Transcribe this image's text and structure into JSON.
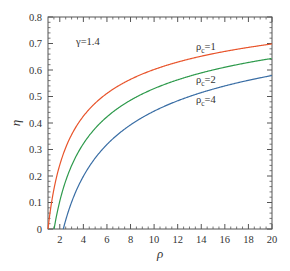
{
  "chart_data": {
    "type": "line",
    "title": "",
    "xlabel": "ρ",
    "ylabel": "η",
    "xlim": [
      1,
      20
    ],
    "ylim": [
      0,
      0.8
    ],
    "grid": false,
    "legend_position": "inline labels",
    "x_ticks": [
      2,
      4,
      6,
      8,
      10,
      12,
      14,
      16,
      18,
      20
    ],
    "x_tick_labels": [
      "2",
      "4",
      "6",
      "8",
      "10",
      "12",
      "14",
      "16",
      "18",
      "20"
    ],
    "y_ticks": [
      0,
      0.1,
      0.2,
      0.3,
      0.4,
      0.5,
      0.6,
      0.7,
      0.8
    ],
    "y_tick_labels": [
      "0",
      "0.1",
      "0.2",
      "0.3",
      "0.4",
      "0.5",
      "0.6",
      "0.7",
      "0.8"
    ],
    "annotations": [
      {
        "text": "γ=1.4",
        "x": 3.5,
        "y": 0.705
      }
    ],
    "x": [
      1,
      1.5,
      2,
      2.3,
      3,
      4,
      5,
      6,
      8,
      10,
      12,
      14,
      16,
      18,
      20
    ],
    "series": [
      {
        "name": "ρc=1",
        "label_main": "ρ",
        "label_sub": "c",
        "label_rest": "=1",
        "color": "#e8542b",
        "values": [
          0.0,
          0.15,
          0.242,
          0.283,
          0.356,
          0.426,
          0.475,
          0.512,
          0.565,
          0.602,
          0.63,
          0.652,
          0.67,
          0.685,
          0.698
        ]
      },
      {
        "name": "ρc=2",
        "label_main": "ρ",
        "label_sub": "c",
        "label_rest": "=2",
        "color": "#2e9a4c",
        "values": [
          null,
          0.0,
          0.112,
          0.164,
          0.254,
          0.34,
          0.4,
          0.445,
          0.509,
          0.554,
          0.588,
          0.614,
          0.636,
          0.654,
          0.67
        ]
      },
      {
        "name": "ρc=4",
        "label_main": "ρ",
        "label_sub": "c",
        "label_rest": "=4",
        "color": "#3a6ea5",
        "values": [
          null,
          null,
          null,
          0.0,
          0.102,
          0.201,
          0.27,
          0.321,
          0.394,
          0.444,
          0.483,
          0.513,
          0.538,
          0.559,
          0.578
        ]
      }
    ]
  }
}
